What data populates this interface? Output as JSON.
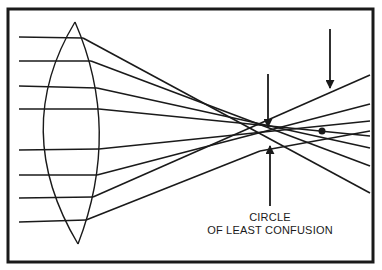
{
  "diagram": {
    "label": {
      "line1": "CIRCLE",
      "line2": "OF LEAST CONFUSION"
    },
    "colors": {
      "stroke": "#1a1a1a",
      "background": "#ffffff"
    },
    "elements": [
      {
        "name": "frame",
        "type": "border-rectangle"
      },
      {
        "name": "biconvex-lens",
        "type": "lens"
      },
      {
        "name": "incident-rays",
        "count": 8
      },
      {
        "name": "refracted-rays",
        "count": 8
      },
      {
        "name": "paraxial-focus-dot",
        "type": "point"
      },
      {
        "name": "arrow-down-marginal-focus",
        "type": "arrow"
      },
      {
        "name": "arrow-down-paraxial-focus",
        "type": "arrow"
      },
      {
        "name": "arrow-up-circle-of-least-confusion",
        "type": "arrow"
      }
    ]
  }
}
